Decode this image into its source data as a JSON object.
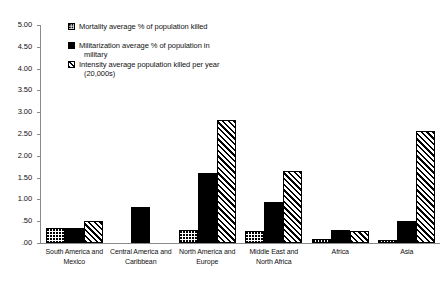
{
  "chart_data": {
    "type": "bar",
    "title": "",
    "xlabel": "",
    "ylabel": "",
    "ylim": [
      0,
      5.0
    ],
    "ytick_labels": [
      "5.00",
      "4.50",
      "4.00",
      "3.50",
      "3.00",
      "2.50",
      "2.00",
      "1.50",
      "1.00",
      ".50",
      ".00"
    ],
    "ytick_values": [
      5.0,
      4.5,
      4.0,
      3.5,
      3.0,
      2.5,
      2.0,
      1.5,
      1.0,
      0.5,
      0.0
    ],
    "grid": false,
    "legend_position": "top-left-inside",
    "categories": [
      "South America and Mexico",
      "Central America and Caribbean",
      "North America and Europe",
      "Middle East and North Africa",
      "Africa",
      "Asia"
    ],
    "series": [
      {
        "name": "Mortality average % of population killed",
        "pattern": "dotted",
        "values": [
          0.35,
          0.0,
          0.3,
          0.28,
          0.1,
          0.08
        ]
      },
      {
        "name": "Militarization average % of population in military",
        "pattern": "solid-black",
        "values": [
          0.35,
          0.82,
          1.6,
          0.95,
          0.3,
          0.5
        ]
      },
      {
        "name": "Intensity average population killed per year (20,000s)",
        "pattern": "diagonal-hatch",
        "values": [
          0.5,
          0.0,
          2.83,
          1.65,
          0.28,
          2.57
        ]
      }
    ]
  },
  "legend": {
    "items": [
      {
        "label": "Mortality average % of population killed",
        "sub": ""
      },
      {
        "label": "Militarization average % of population in",
        "sub": "military"
      },
      {
        "label": "Intensity average population killed per year",
        "sub": "(20,000s)"
      }
    ]
  },
  "colors": {
    "axis": "#8a8a8a",
    "bar_outline": "#000000",
    "bar_solid": "#000000",
    "background": "#ffffff",
    "text": "#111111"
  }
}
